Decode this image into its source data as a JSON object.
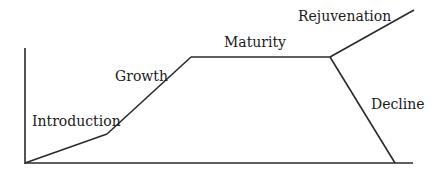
{
  "diagram": {
    "type": "product-life-cycle",
    "stages": [
      {
        "id": "introduction",
        "label": "Introduction",
        "from": [
          25,
          163
        ],
        "to": [
          107,
          134
        ],
        "label_pos": [
          20,
          126
        ]
      },
      {
        "id": "growth",
        "label": "Growth",
        "from": [
          107,
          134
        ],
        "to": [
          191,
          57
        ],
        "label_pos": [
          115,
          80
        ]
      },
      {
        "id": "maturity",
        "label": "Maturity",
        "from": [
          191,
          57
        ],
        "to": [
          330,
          57
        ],
        "label_pos": [
          225,
          46
        ]
      },
      {
        "id": "rejuvenation",
        "label": "Rejuvenation",
        "from": [
          330,
          57
        ],
        "to": [
          414,
          10
        ],
        "label_pos": [
          298,
          21
        ]
      },
      {
        "id": "decline",
        "label": "Decline",
        "from": [
          330,
          57
        ],
        "to": [
          395,
          163
        ],
        "label_pos": [
          371,
          108
        ]
      }
    ],
    "axes": {
      "y_axis": {
        "x": 25,
        "top": 48,
        "bottom": 163
      },
      "x_axis": {
        "y": 163,
        "left": 25,
        "right": 413
      }
    },
    "line_color": "#2a2a2a"
  }
}
